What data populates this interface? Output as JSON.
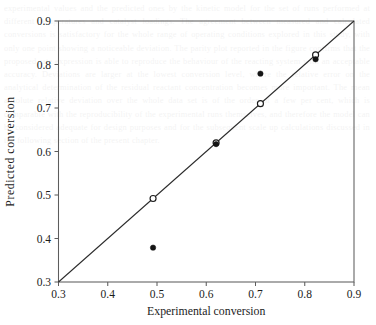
{
  "figure": {
    "background_color": "#ffffff",
    "frame_color": "#5d5d5d",
    "line_color": "#2a2a2a",
    "marker_color": "#151515"
  },
  "bleed_through": {
    "text": "experimental values and the predicted ones by the kinetic model for the set of runs performed at different temperatures and catalyst loadings. The agreement between measured and calculated conversions is satisfactory for the whole range of operating conditions explored in this study, with only one point showing a noticeable deviation. The parity plot reported in the figure confirms that the proposed rate expression is able to reproduce the behaviour of the reacting system with an acceptable accuracy. Deviations are larger at the lowest conversion level, where the relative error on the analytical determination of the residual reactant concentration becomes more important. The mean absolute relative deviation over the whole data set is of the order of a few per cent, which is comparable with the reproducibility of the experimental runs themselves, and therefore the model can be considered adequate for design purposes and for the subsequent scale up calculations discussed in the following section of the present chapter."
  },
  "chart_data": {
    "type": "scatter",
    "title": "",
    "xlabel": "Experimental conversion",
    "ylabel": "Predicted  conversion",
    "xlim": [
      0.3,
      0.9
    ],
    "ylim": [
      0.3,
      0.9
    ],
    "xticks": [
      "0.3",
      "0.4",
      "0.5",
      "0.6",
      "0.7",
      "0.8",
      "0.9"
    ],
    "yticks": [
      "0.3",
      "0.4",
      "0.5",
      "0.6",
      "0.7",
      "0.8",
      "0.9"
    ],
    "xtick_values": [
      0.3,
      0.4,
      0.5,
      0.6,
      0.7,
      0.8,
      0.9
    ],
    "ytick_values": [
      0.3,
      0.4,
      0.5,
      0.6,
      0.7,
      0.8,
      0.9
    ],
    "grid": false,
    "legend": false,
    "legend_position": "none",
    "tick_direction": "out",
    "frame": "box",
    "reference_line": {
      "label": "y = x parity line",
      "from": [
        0.3,
        0.3
      ],
      "to": [
        0.9,
        0.9
      ]
    },
    "series": [
      {
        "name": "Open markers (on parity line)",
        "marker": "open-circle",
        "points": [
          {
            "x": 0.492,
            "y": 0.492
          },
          {
            "x": 0.62,
            "y": 0.62
          },
          {
            "x": 0.71,
            "y": 0.71
          },
          {
            "x": 0.822,
            "y": 0.822
          }
        ]
      },
      {
        "name": "Filled markers",
        "marker": "filled-circle",
        "points": [
          {
            "x": 0.492,
            "y": 0.379
          },
          {
            "x": 0.62,
            "y": 0.617
          },
          {
            "x": 0.71,
            "y": 0.779
          },
          {
            "x": 0.822,
            "y": 0.812
          }
        ]
      }
    ]
  }
}
